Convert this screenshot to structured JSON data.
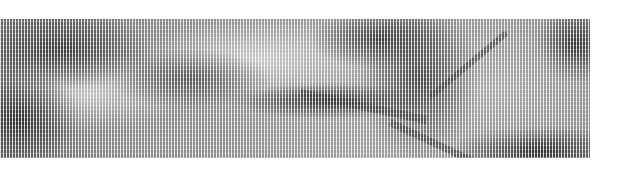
{
  "image": {
    "description": "Dithered grayscale photograph (vertical scan-line halftone) of a natural terrain scene with dark ridges and lighter textured areas",
    "colors": {
      "background": "#ffffff",
      "dark_tone": "#2e2e2e",
      "mid_tone": "#9a9a9a",
      "light_tone": "#c8c8c8"
    }
  }
}
